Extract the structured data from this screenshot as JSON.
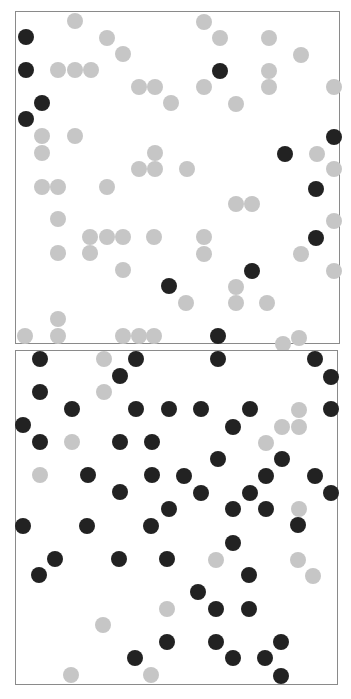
{
  "figure": {
    "width": 351,
    "height": 699,
    "dot_radius": 8,
    "colors": {
      "gray": "#c6c6c6",
      "black": "#222222",
      "frame": "#8a8a8a"
    }
  },
  "chart_data": [
    {
      "type": "scatter",
      "title": "",
      "panel": "top",
      "frame": {
        "x": 15,
        "y": 11,
        "width": 325,
        "height": 333
      },
      "xlabel": "",
      "ylabel": "",
      "grid": false,
      "legend": null,
      "points": [
        [
          10,
          25,
          "black"
        ],
        [
          10,
          58,
          "black"
        ],
        [
          26,
          91,
          "black"
        ],
        [
          10,
          107,
          "black"
        ],
        [
          59,
          9,
          "gray"
        ],
        [
          91,
          26,
          "gray"
        ],
        [
          107,
          42,
          "gray"
        ],
        [
          42,
          58,
          "gray"
        ],
        [
          59,
          58,
          "gray"
        ],
        [
          75,
          58,
          "gray"
        ],
        [
          123,
          75,
          "gray"
        ],
        [
          139,
          75,
          "gray"
        ],
        [
          155,
          91,
          "gray"
        ],
        [
          26,
          124,
          "gray"
        ],
        [
          59,
          124,
          "gray"
        ],
        [
          26,
          141,
          "gray"
        ],
        [
          139,
          141,
          "gray"
        ],
        [
          123,
          157,
          "gray"
        ],
        [
          139,
          157,
          "gray"
        ],
        [
          188,
          10,
          "gray"
        ],
        [
          204,
          26,
          "gray"
        ],
        [
          253,
          26,
          "gray"
        ],
        [
          285,
          43,
          "gray"
        ],
        [
          204,
          59,
          "black"
        ],
        [
          253,
          59,
          "gray"
        ],
        [
          188,
          75,
          "gray"
        ],
        [
          253,
          75,
          "gray"
        ],
        [
          318,
          75,
          "gray"
        ],
        [
          220,
          92,
          "gray"
        ],
        [
          318,
          125,
          "black"
        ],
        [
          269,
          142,
          "black"
        ],
        [
          301,
          142,
          "gray"
        ],
        [
          318,
          157,
          "gray"
        ],
        [
          171,
          157,
          "gray"
        ],
        [
          26,
          175,
          "gray"
        ],
        [
          42,
          175,
          "gray"
        ],
        [
          91,
          175,
          "gray"
        ],
        [
          42,
          207,
          "gray"
        ],
        [
          74,
          225,
          "gray"
        ],
        [
          91,
          225,
          "gray"
        ],
        [
          107,
          225,
          "gray"
        ],
        [
          138,
          225,
          "gray"
        ],
        [
          42,
          241,
          "gray"
        ],
        [
          74,
          241,
          "gray"
        ],
        [
          107,
          258,
          "gray"
        ],
        [
          153,
          274,
          "black"
        ],
        [
          42,
          307,
          "gray"
        ],
        [
          9,
          324,
          "gray"
        ],
        [
          42,
          324,
          "gray"
        ],
        [
          107,
          324,
          "gray"
        ],
        [
          123,
          324,
          "gray"
        ],
        [
          138,
          324,
          "gray"
        ],
        [
          300,
          177,
          "black"
        ],
        [
          220,
          192,
          "gray"
        ],
        [
          236,
          192,
          "gray"
        ],
        [
          300,
          226,
          "black"
        ],
        [
          318,
          209,
          "gray"
        ],
        [
          285,
          242,
          "gray"
        ],
        [
          188,
          225,
          "gray"
        ],
        [
          188,
          242,
          "gray"
        ],
        [
          236,
          259,
          "black"
        ],
        [
          318,
          259,
          "gray"
        ],
        [
          220,
          275,
          "gray"
        ],
        [
          220,
          291,
          "gray"
        ],
        [
          170,
          291,
          "gray"
        ],
        [
          251,
          291,
          "gray"
        ],
        [
          202,
          324,
          "black"
        ],
        [
          267,
          332,
          "gray"
        ],
        [
          283,
          326,
          "gray"
        ]
      ]
    },
    {
      "type": "scatter",
      "title": "",
      "panel": "bottom",
      "frame": {
        "x": 15,
        "y": 350,
        "width": 323,
        "height": 335
      },
      "xlabel": "",
      "ylabel": "",
      "grid": false,
      "legend": null,
      "points": [
        [
          24,
          8,
          "black"
        ],
        [
          88,
          8,
          "gray"
        ],
        [
          120,
          8,
          "black"
        ],
        [
          104,
          25,
          "black"
        ],
        [
          24,
          41,
          "black"
        ],
        [
          88,
          41,
          "gray"
        ],
        [
          56,
          58,
          "black"
        ],
        [
          120,
          58,
          "black"
        ],
        [
          153,
          58,
          "black"
        ],
        [
          7,
          74,
          "black"
        ],
        [
          24,
          91,
          "black"
        ],
        [
          56,
          91,
          "gray"
        ],
        [
          104,
          91,
          "black"
        ],
        [
          136,
          91,
          "black"
        ],
        [
          24,
          124,
          "gray"
        ],
        [
          72,
          124,
          "black"
        ],
        [
          136,
          124,
          "black"
        ],
        [
          104,
          141,
          "black"
        ],
        [
          153,
          158,
          "black"
        ],
        [
          202,
          8,
          "black"
        ],
        [
          299,
          8,
          "black"
        ],
        [
          315,
          26,
          "black"
        ],
        [
          185,
          58,
          "black"
        ],
        [
          234,
          58,
          "black"
        ],
        [
          283,
          59,
          "gray"
        ],
        [
          315,
          58,
          "black"
        ],
        [
          217,
          76,
          "black"
        ],
        [
          266,
          76,
          "gray"
        ],
        [
          283,
          76,
          "gray"
        ],
        [
          250,
          92,
          "gray"
        ],
        [
          202,
          108,
          "black"
        ],
        [
          266,
          108,
          "black"
        ],
        [
          168,
          125,
          "black"
        ],
        [
          250,
          125,
          "black"
        ],
        [
          299,
          125,
          "black"
        ],
        [
          185,
          142,
          "black"
        ],
        [
          234,
          142,
          "black"
        ],
        [
          315,
          142,
          "black"
        ],
        [
          217,
          158,
          "black"
        ],
        [
          250,
          158,
          "black"
        ],
        [
          283,
          158,
          "gray"
        ],
        [
          7,
          175,
          "black"
        ],
        [
          71,
          175,
          "black"
        ],
        [
          135,
          175,
          "black"
        ],
        [
          39,
          208,
          "black"
        ],
        [
          103,
          208,
          "black"
        ],
        [
          151,
          208,
          "black"
        ],
        [
          23,
          224,
          "black"
        ],
        [
          151,
          258,
          "gray"
        ],
        [
          87,
          274,
          "gray"
        ],
        [
          151,
          291,
          "black"
        ],
        [
          119,
          307,
          "black"
        ],
        [
          55,
          324,
          "gray"
        ],
        [
          135,
          324,
          "gray"
        ],
        [
          282,
          174,
          "black"
        ],
        [
          217,
          192,
          "black"
        ],
        [
          200,
          209,
          "gray"
        ],
        [
          233,
          224,
          "black"
        ],
        [
          282,
          209,
          "gray"
        ],
        [
          297,
          225,
          "gray"
        ],
        [
          182,
          241,
          "black"
        ],
        [
          200,
          258,
          "black"
        ],
        [
          233,
          258,
          "black"
        ],
        [
          200,
          291,
          "black"
        ],
        [
          265,
          291,
          "black"
        ],
        [
          217,
          307,
          "black"
        ],
        [
          249,
          307,
          "black"
        ],
        [
          265,
          325,
          "black"
        ]
      ]
    }
  ]
}
